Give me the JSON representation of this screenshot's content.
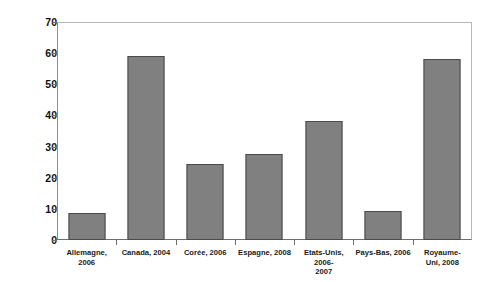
{
  "chart_data": {
    "type": "bar",
    "title": "",
    "xlabel": "",
    "ylabel": "En % du produit des impôts directs",
    "ylim": [
      0,
      70
    ],
    "ytick_labels": [
      "70",
      "60",
      "50",
      "40",
      "30",
      "20",
      "10",
      "0"
    ],
    "yticks": [
      70,
      60,
      50,
      40,
      30,
      20,
      10,
      0
    ],
    "grid": false,
    "legend": "none",
    "bar_color": "#808080",
    "bar_edge_color": "#4a4a4a",
    "categories": [
      "Allemagne, 2006",
      "Canada, 2004",
      "Corée, 2006",
      "Espagne, 2008",
      "Etats-Unis, 2006-2007",
      "Pays-Bas, 2006",
      "Royaume-Uni, 2008"
    ],
    "category_lines": [
      [
        "Allemagne, 2006"
      ],
      [
        "Canada, 2004"
      ],
      [
        "Corée, 2006"
      ],
      [
        "Espagne, 2008"
      ],
      [
        "Etats-Unis, 2006-",
        "2007"
      ],
      [
        "Pays-Bas, 2006"
      ],
      [
        "Royaume-",
        "Uni, 2008"
      ]
    ],
    "values": [
      8.7,
      59.2,
      24.4,
      27.7,
      38.3,
      9.3,
      58.2
    ]
  }
}
